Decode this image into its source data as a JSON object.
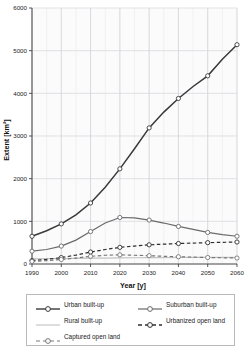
{
  "chart_data": {
    "type": "line",
    "title": "",
    "xlabel": "Year [y]",
    "ylabel": "Extent [km²]",
    "xlim": [
      1990,
      2060
    ],
    "ylim": [
      0,
      6000
    ],
    "xticks": [
      1990,
      2000,
      2010,
      2020,
      2030,
      2040,
      2050,
      2060
    ],
    "yticks": [
      0,
      1000,
      2000,
      3000,
      4000,
      5000,
      6000
    ],
    "grid": true,
    "legend_position": "below",
    "x": [
      1990,
      1995,
      2000,
      2005,
      2010,
      2015,
      2020,
      2025,
      2030,
      2035,
      2040,
      2045,
      2050,
      2055,
      2060
    ],
    "series": [
      {
        "name": "Urban built-up",
        "marker": "open-circle",
        "line_style": "solid",
        "color": "#3a3a3a",
        "values": [
          650,
          780,
          940,
          1150,
          1430,
          1800,
          2230,
          2700,
          3190,
          3560,
          3880,
          4160,
          4410,
          4800,
          5140
        ]
      },
      {
        "name": "Suburban built-up",
        "marker": "open-circle",
        "line_style": "solid",
        "color": "#6a6a6a",
        "values": [
          300,
          340,
          420,
          560,
          760,
          960,
          1090,
          1080,
          1030,
          960,
          880,
          810,
          740,
          690,
          650
        ]
      },
      {
        "name": "Rural built-up",
        "marker": "none",
        "line_style": "solid",
        "color": "#c2c2c2",
        "values": [
          120,
          124,
          128,
          132,
          136,
          140,
          143,
          146,
          148,
          150,
          152,
          153,
          154,
          155,
          156
        ]
      },
      {
        "name": "Urbanized open land",
        "marker": "open-circle",
        "line_style": "dashed",
        "color": "#2f2f2f",
        "values": [
          80,
          110,
          150,
          210,
          280,
          340,
          390,
          420,
          450,
          465,
          480,
          490,
          500,
          508,
          515
        ]
      },
      {
        "name": "Captured open land",
        "marker": "open-circle",
        "line_style": "dashed",
        "color": "#787878",
        "values": [
          60,
          80,
          105,
          140,
          180,
          205,
          215,
          205,
          195,
          180,
          170,
          160,
          152,
          146,
          140
        ]
      }
    ]
  },
  "legend": {
    "items": [
      {
        "label": "Urban built-up"
      },
      {
        "label": "Suburban built-up"
      },
      {
        "label": "Rural built-up"
      },
      {
        "label": "Urbanized open land"
      },
      {
        "label": "Captured open land"
      }
    ]
  }
}
